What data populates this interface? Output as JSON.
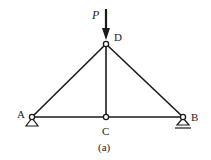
{
  "diagram": {
    "type": "truss",
    "caption": "(a)",
    "load": {
      "label": "P",
      "at_node": "D",
      "direction": "down"
    },
    "nodes": [
      {
        "id": "A",
        "label": "A",
        "x": 32,
        "y": 117,
        "support": "pin"
      },
      {
        "id": "B",
        "label": "B",
        "x": 183,
        "y": 117,
        "support": "roller"
      },
      {
        "id": "C",
        "label": "C",
        "x": 106,
        "y": 117
      },
      {
        "id": "D",
        "label": "D",
        "x": 106,
        "y": 44
      }
    ],
    "members": [
      [
        "A",
        "D"
      ],
      [
        "D",
        "B"
      ],
      [
        "A",
        "C"
      ],
      [
        "C",
        "B"
      ],
      [
        "C",
        "D"
      ]
    ],
    "colors": {
      "stroke": "#1a1a1a",
      "background": "#ffffff"
    }
  }
}
